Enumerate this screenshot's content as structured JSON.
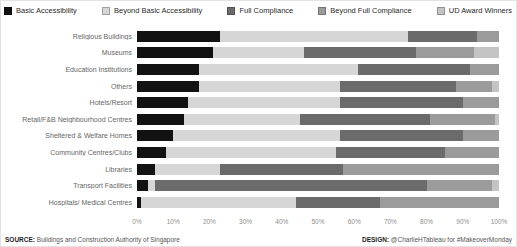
{
  "legend": [
    {
      "label": "Basic Accessibility",
      "color": "#121212"
    },
    {
      "label": "Beyond Basic Accessibility",
      "color": "#d6d6d6"
    },
    {
      "label": "Full Compliance",
      "color": "#6b6b6b"
    },
    {
      "label": "Beyond Full Compliance",
      "color": "#9b9b9b"
    },
    {
      "label": "UD Award Winners",
      "color": "#c4c4c4"
    }
  ],
  "chart_data": {
    "type": "bar",
    "subtype": "horizontal-stacked-100pct",
    "categories": [
      "Religious Buildings",
      "Museums",
      "Education Institutions",
      "Others",
      "Hotels/Resort",
      "Retail/F&B Neighbourhood Centres",
      "Sheltered & Welfare Homes",
      "Community Centres/Clubs",
      "Libraries",
      "Transport Facilities",
      "Hospitals/ Medical Centres"
    ],
    "series": [
      {
        "name": "Basic Accessibility",
        "color": "#121212",
        "values": [
          23,
          21,
          17,
          17,
          14,
          13,
          10,
          8,
          5,
          3,
          1
        ]
      },
      {
        "name": "Beyond Basic Accessibility",
        "color": "#d6d6d6",
        "values": [
          52,
          25,
          44,
          39,
          42,
          32,
          46,
          47,
          18,
          2,
          43
        ]
      },
      {
        "name": "Full Compliance",
        "color": "#6b6b6b",
        "values": [
          19,
          31,
          31,
          32,
          34,
          36,
          34,
          30,
          34,
          75,
          23
        ]
      },
      {
        "name": "Beyond Full Compliance",
        "color": "#9b9b9b",
        "values": [
          6,
          16,
          8,
          10,
          10,
          18,
          10,
          15,
          43,
          18,
          33
        ]
      },
      {
        "name": "UD Award Winners",
        "color": "#c4c4c4",
        "values": [
          0,
          7,
          0,
          2,
          0,
          1,
          0,
          0,
          0,
          2,
          0
        ]
      }
    ],
    "x_ticks": [
      "0%",
      "10%",
      "20%",
      "30%",
      "40%",
      "50%",
      "60%",
      "70%",
      "80%",
      "90%",
      "100%"
    ],
    "xlim": [
      0,
      100
    ],
    "title": "",
    "xlabel": "",
    "ylabel": "",
    "grid": false,
    "legend_position": "top"
  },
  "footer": {
    "source_label": "SOURCE:",
    "source_text": " Buildings and Construction Authority of Singapore",
    "design_label": "DESIGN:",
    "design_text": " @CharlieHTableau for #MakeoverMonday"
  }
}
